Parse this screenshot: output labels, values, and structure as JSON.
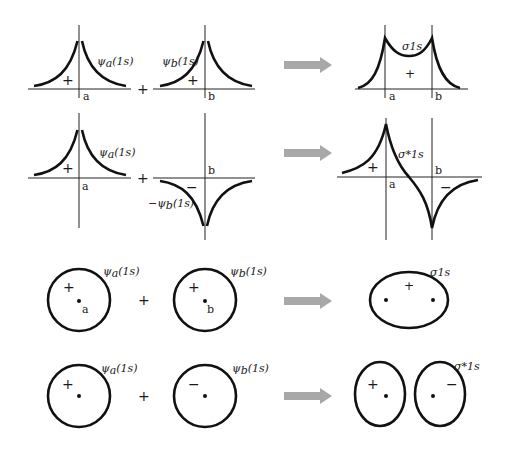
{
  "diagram": {
    "operator": "+",
    "arrow": "right-arrow",
    "colors": {
      "line": "#111111",
      "arrow": "#a8a8a8",
      "background": "#ffffff"
    },
    "rows": [
      {
        "id": "bonding-wavefunction-plot",
        "left": {
          "label_fn": "ψ",
          "label_sub": "a",
          "label_arg": "(1s)",
          "sign": "+",
          "nucleus": "a"
        },
        "right": {
          "label_fn": "ψ",
          "label_sub": "b",
          "label_arg": "(1s)",
          "sign": "+",
          "nucleus": "b"
        },
        "result": {
          "label": "σ1s",
          "sign": "+",
          "nuclei": [
            "a",
            "b"
          ]
        }
      },
      {
        "id": "antibonding-wavefunction-plot",
        "left": {
          "label_fn": "ψ",
          "label_sub": "a",
          "label_arg": "(1s)",
          "sign": "+",
          "nucleus": "a"
        },
        "right": {
          "label_fn": "−ψ",
          "label_sub": "b",
          "label_arg": "(1s)",
          "sign": "−",
          "nucleus": "b"
        },
        "result": {
          "label": "σ*1s",
          "signs": [
            "+",
            "−"
          ],
          "nuclei": [
            "a",
            "b"
          ]
        }
      },
      {
        "id": "bonding-orbital-contour",
        "left": {
          "label_fn": "ψ",
          "label_sub": "a",
          "label_arg": "(1s)",
          "sign": "+",
          "nucleus": "a"
        },
        "right": {
          "label_fn": "ψ",
          "label_sub": "b",
          "label_arg": "(1s)",
          "sign": "+",
          "nucleus": "b"
        },
        "result": {
          "label": "σ1s",
          "sign": "+"
        }
      },
      {
        "id": "antibonding-orbital-contour",
        "left": {
          "label_fn": "ψ",
          "label_sub": "a",
          "label_arg": "(1s)",
          "sign": "+"
        },
        "right": {
          "label_fn": "ψ",
          "label_sub": "b",
          "label_arg": "(1s)",
          "sign": "−"
        },
        "result": {
          "label": "σ*1s",
          "signs": [
            "+",
            "−"
          ]
        }
      }
    ]
  }
}
